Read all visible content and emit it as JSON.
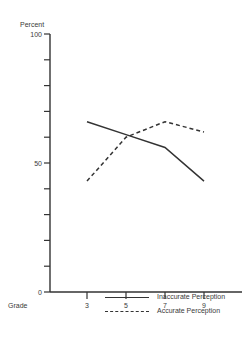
{
  "chart_data": {
    "type": "line",
    "title": "",
    "xlabel": "Grade",
    "ylabel": "Percent",
    "x": [
      3,
      5,
      7,
      9
    ],
    "categories": [
      "3",
      "5",
      "7",
      "9"
    ],
    "y_ticks": [
      0,
      10,
      20,
      30,
      40,
      50,
      60,
      70,
      80,
      90,
      100
    ],
    "y_tick_labels": [
      "0",
      "50",
      "100"
    ],
    "ylim": [
      0,
      100
    ],
    "grid": false,
    "legend_position": "bottom",
    "series": [
      {
        "name": "Inaccurate Perception",
        "style": "solid",
        "values": [
          66,
          61,
          56,
          43
        ]
      },
      {
        "name": "Accurate Perception",
        "style": "dashed",
        "values": [
          43,
          60,
          66,
          62
        ]
      }
    ]
  },
  "axes": {
    "y_title": "Percent",
    "x_title": "Grade",
    "y_label_0": "0",
    "y_label_50": "50",
    "y_label_100": "100"
  },
  "legend": {
    "solid_label": "Inaccurate Perception",
    "dashed_label": "Accurate Perception"
  },
  "colors": {
    "ink": "#333333",
    "background": "#ffffff"
  }
}
